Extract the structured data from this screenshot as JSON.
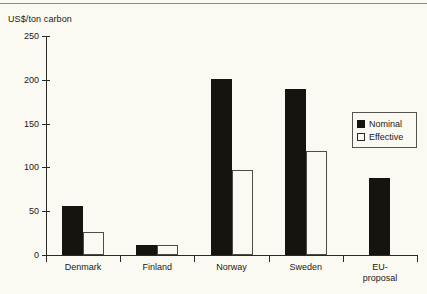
{
  "chart_data": {
    "type": "bar",
    "title": "",
    "subtitle": "",
    "xlabel": "",
    "ylabel": "US$/ton carbon",
    "categories": [
      "Denmark",
      "Finland",
      "Norway",
      "Sweden",
      "EU-proposal"
    ],
    "category_lines": [
      [
        "Denmark"
      ],
      [
        "Finland"
      ],
      [
        "Norway"
      ],
      [
        "Sweden"
      ],
      [
        "EU-",
        "proposal"
      ]
    ],
    "series": [
      {
        "name": "Nominal",
        "color": "#15140f",
        "style": "filled",
        "values": [
          56,
          12,
          201,
          190,
          88
        ]
      },
      {
        "name": "Effective",
        "color": "#faf9f2",
        "style": "hollow",
        "values": [
          26,
          12,
          97,
          119,
          null
        ]
      }
    ],
    "ylim": [
      0,
      250
    ],
    "yticks": [
      0,
      50,
      100,
      150,
      200,
      250
    ],
    "ytick_labels": [
      "0",
      "50",
      "100",
      "150",
      "200",
      "250"
    ],
    "grid": false,
    "legend_position": "inside-right"
  },
  "legend": {
    "entries": [
      {
        "label": "Nominal"
      },
      {
        "label": "Effective"
      }
    ]
  }
}
